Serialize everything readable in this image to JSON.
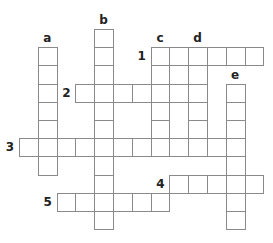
{
  "puzzle": {
    "type": "crossword",
    "grid": {
      "origin_x": 19,
      "origin_y": 29,
      "cell_w": 18.8,
      "cell_h": 18.2
    },
    "words": [
      {
        "label": "1",
        "direction": "across",
        "row": 1,
        "col": 7,
        "length": 6
      },
      {
        "label": "2",
        "direction": "across",
        "row": 3,
        "col": 3,
        "length": 7
      },
      {
        "label": "3",
        "direction": "across",
        "row": 6,
        "col": 0,
        "length": 12
      },
      {
        "label": "4",
        "direction": "across",
        "row": 8,
        "col": 8,
        "length": 5
      },
      {
        "label": "5",
        "direction": "across",
        "row": 9,
        "col": 2,
        "length": 6
      },
      {
        "label": "a",
        "direction": "down",
        "row": 1,
        "col": 1,
        "length": 7
      },
      {
        "label": "b",
        "direction": "down",
        "row": 0,
        "col": 4,
        "length": 11
      },
      {
        "label": "c",
        "direction": "down",
        "row": 1,
        "col": 7,
        "length": 6
      },
      {
        "label": "d",
        "direction": "down",
        "row": 1,
        "col": 9,
        "length": 6
      },
      {
        "label": "e",
        "direction": "down",
        "row": 3,
        "col": 11,
        "length": 8
      }
    ]
  }
}
